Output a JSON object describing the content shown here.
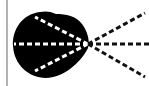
{
  "diagram": {
    "type": "radiation-pattern",
    "colors": {
      "background": "#ffffff",
      "lobe": "#000000",
      "inner_rays": "#ffffff",
      "outer_rays": "#111111",
      "baseline": "#9a9a9a"
    },
    "focal_point": {
      "x": 88,
      "y": 44
    },
    "baseline": {
      "x": 7,
      "y1": 0,
      "y2": 86
    },
    "lobe": {
      "path": "M 40 12 C 22 14, 12 30, 13 46 C 14 64, 28 78, 46 78 C 62 78, 80 64, 88 48 C 90 42, 88 32, 82 24 C 76 16, 66 14, 56 14 C 50 11, 45 11, 40 12 Z"
    },
    "inner_rays": [
      {
        "name": "inner-ray-left",
        "x1": 88,
        "y1": 44,
        "x2": 14,
        "y2": 44
      },
      {
        "name": "inner-ray-upper",
        "x1": 88,
        "y1": 44,
        "x2": 35,
        "y2": 17
      },
      {
        "name": "inner-ray-lower",
        "x1": 88,
        "y1": 44,
        "x2": 35,
        "y2": 71
      }
    ],
    "outer_rays": [
      {
        "name": "outer-ray-upper",
        "x1": 88,
        "y1": 44,
        "x2": 145,
        "y2": 13
      },
      {
        "name": "outer-ray-middle",
        "x1": 88,
        "y1": 44,
        "x2": 149,
        "y2": 44
      },
      {
        "name": "outer-ray-lower",
        "x1": 88,
        "y1": 44,
        "x2": 145,
        "y2": 77
      }
    ],
    "dash": {
      "length": 5,
      "gap": 3,
      "width": 3
    }
  }
}
